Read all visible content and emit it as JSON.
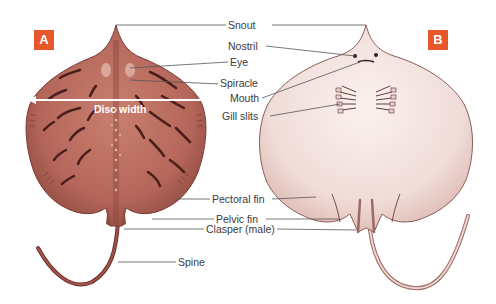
{
  "figure": {
    "panels": [
      {
        "id": "A",
        "badge": "A",
        "view": "dorsal"
      },
      {
        "id": "B",
        "badge": "B",
        "view": "ventral"
      }
    ],
    "measurement": {
      "label": "Disc width"
    },
    "labels": {
      "snout": "Snout",
      "nostril": "Nostril",
      "eye": "Eye",
      "spiracle": "Spiracle",
      "mouth": "Mouth",
      "gill_slits": "Gill slits",
      "pectoral_fin": "Pectoral fin",
      "pelvic_fin": "Pelvic fin",
      "clasper": "Clasper (male)",
      "spine": "Spine"
    },
    "colors": {
      "badge": "#e8572a",
      "dorsal_body": "#b4665a",
      "dorsal_markings": "#4a1e1a",
      "ventral_body": "#f1dedb",
      "leader_line": "#555555"
    }
  }
}
